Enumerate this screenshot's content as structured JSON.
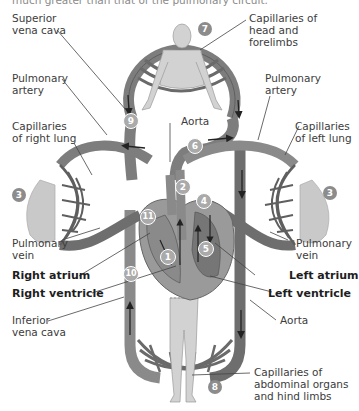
{
  "caption_cut": "much greater than that of the pulmonary circuit.",
  "labels": {
    "superior_vena_cava": "Superior\nvena cava",
    "capillaries_head": "Capillaries of\nhead and\nforelimbs",
    "pulmonary_artery_left_side": "Pulmonary\nartery",
    "pulmonary_artery_right_side": "Pulmonary\nartery",
    "aorta_top": "Aorta",
    "capillaries_right_lung": "Capillaries\nof right lung",
    "capillaries_left_lung": "Capillaries\nof left lung",
    "pulmonary_vein_left_side": "Pulmonary\nvein",
    "pulmonary_vein_right_side": "Pulmonary\nvein",
    "right_atrium": "Right atrium",
    "left_atrium": "Left atrium",
    "right_ventricle": "Right ventricle",
    "left_ventricle": "Left ventricle",
    "inferior_vena_cava": "Inferior\nvena cava",
    "aorta_bottom": "Aorta",
    "capillaries_abdominal": "Capillaries of\nabdominal organs\nand hind limbs"
  },
  "step_numbers": {
    "n1": "1",
    "n2": "2",
    "n3_left": "3",
    "n3_right": "3",
    "n4": "4",
    "n5": "5",
    "n6": "6",
    "n7": "7",
    "n8": "8",
    "n9": "9",
    "n10": "10",
    "n11": "11"
  },
  "colors": {
    "vessel_gray": "#7d7d7d",
    "vessel_dark": "#5f5f5f",
    "body_fill": "#d2d2d2",
    "lung_fill": "#c9c9c9",
    "heart_fill": "#9a9a9a",
    "badge_fill": "#8c8c8c",
    "badge_text": "#ffffff"
  }
}
